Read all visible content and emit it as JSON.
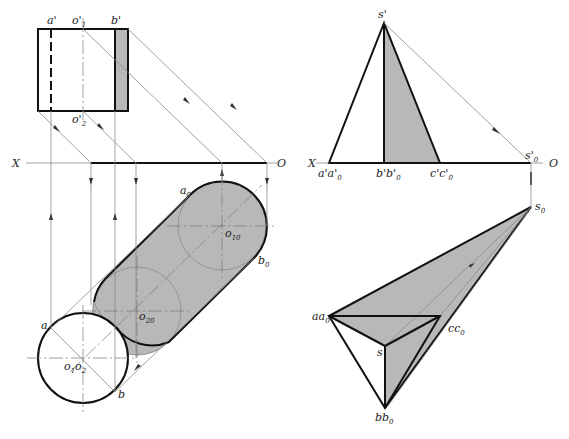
{
  "figure": {
    "left_panel": {
      "name": "cylinder-shadow",
      "axis_labels": {
        "x": "X",
        "o": "O"
      },
      "front_view_labels": {
        "a": "a'",
        "o1": "o'",
        "o1_sub": "1",
        "b": "b'",
        "o2": "o'",
        "o2_sub": "2"
      },
      "top_view_labels": {
        "a": "a",
        "b": "b",
        "o1o2": "o",
        "o1o2_sub1": "1",
        "o1o2_mid": "o",
        "o1o2_sub2": "2"
      },
      "shadow_labels": {
        "a0": "a",
        "a0_sub": "0",
        "b0": "b",
        "b0_sub": "0",
        "o10": "o",
        "o10_sub": "10",
        "o20": "o",
        "o20_sub": "20"
      }
    },
    "right_panel": {
      "name": "pyramid-shadow",
      "axis_labels": {
        "x": "X",
        "o": "O"
      },
      "front_view_labels": {
        "s": "s'",
        "a": "a'a'",
        "a_sub": "0",
        "b": "b'b'",
        "b_sub": "0",
        "c": "c'c'",
        "c_sub": "0",
        "s0": "s'",
        "s0_sub": "0"
      },
      "top_view_labels": {
        "a": "aa",
        "a_sub": "0",
        "b": "bb",
        "b_sub": "0",
        "c": "cc",
        "c_sub": "0",
        "s": "s",
        "s0": "s",
        "s0_sub": "0"
      }
    },
    "colors": {
      "shadow": "#b8b8b8",
      "outline": "#111111",
      "construction": "#8a8a8a"
    }
  }
}
